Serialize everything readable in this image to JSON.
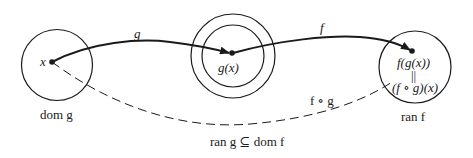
{
  "diagram": {
    "type": "function-composition",
    "colors": {
      "stroke": "#1a1a1a",
      "background": "#ffffff"
    },
    "sets": [
      {
        "id": "dom-g",
        "label": "dom g"
      },
      {
        "id": "ran-g-sub-dom-f",
        "label": "ran g ⊆ dom f"
      },
      {
        "id": "ran-f",
        "label": "ran f"
      }
    ],
    "points": {
      "x": "x",
      "gx": "g(x)",
      "fgx": "f(g(x))",
      "equals": "||",
      "fog_x": "(f ∘ g)(x)"
    },
    "arrows": {
      "g": "g",
      "f": "f",
      "composite": "f ∘ g"
    }
  }
}
